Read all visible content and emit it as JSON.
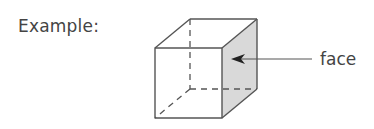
{
  "example_label": "Example:",
  "diagram": {
    "callout_label": "face",
    "colors": {
      "edge": "#555555",
      "shaded_face": "#d9d9d9",
      "text": "#444444"
    },
    "vertices": {
      "front_top_left": [
        155,
        48
      ],
      "front_top_right": [
        222,
        48
      ],
      "front_bottom_left": [
        155,
        118
      ],
      "front_bottom_right": [
        222,
        118
      ],
      "back_top_left": [
        190,
        19
      ],
      "back_top_right": [
        257,
        19
      ],
      "back_bottom_right": [
        257,
        89
      ],
      "back_bottom_left_hidden": [
        190,
        89
      ]
    }
  }
}
